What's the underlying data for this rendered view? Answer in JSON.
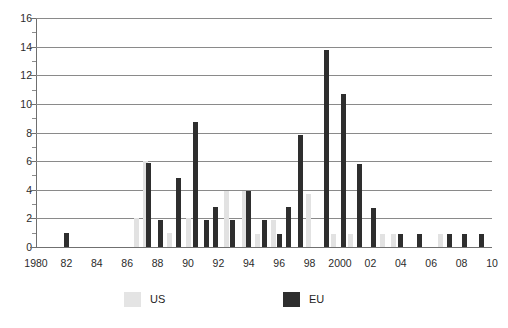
{
  "chart_data": {
    "type": "bar",
    "title": "",
    "subtitle": "",
    "xlabel": "",
    "ylabel": "",
    "xlim": [
      1980,
      2010
    ],
    "ylim": [
      0,
      16
    ],
    "ytick_step": 2,
    "yticks": [
      0,
      2,
      4,
      6,
      8,
      10,
      12,
      14,
      16
    ],
    "ytick_labels": [
      "0",
      "2",
      "4",
      "6",
      "8",
      "10",
      "12",
      "14",
      "16"
    ],
    "yminor_ticks": [
      1,
      3,
      5,
      7,
      9,
      11,
      13,
      15
    ],
    "grid": true,
    "grid_axis": "y",
    "legend_position": "bottom",
    "x": [
      1980,
      1981,
      1982,
      1983,
      1984,
      1985,
      1986,
      1987,
      1988,
      1989,
      1990,
      1991,
      1992,
      1993,
      1994,
      1995,
      1996,
      1997,
      1998,
      1999,
      2000,
      2001,
      2002,
      2003,
      2004,
      2005,
      2006,
      2007,
      2008,
      2009,
      2010
    ],
    "xtick_labels": [
      "1980",
      "82",
      "84",
      "86",
      "88",
      "90",
      "92",
      "94",
      "96",
      "98",
      "2000",
      "02",
      "04",
      "06",
      "08",
      "10"
    ],
    "xticks": [
      1980,
      1982,
      1984,
      1986,
      1988,
      1990,
      1992,
      1994,
      1996,
      1998,
      2000,
      2002,
      2004,
      2006,
      2008,
      2010
    ],
    "series": [
      {
        "name": "US",
        "color": "#e2e2e2",
        "values": [
          0,
          0,
          0,
          0,
          0,
          0,
          2,
          6,
          1,
          4.8,
          0,
          2.9,
          3.9,
          0,
          1,
          0,
          3.7,
          4.6,
          0.9,
          0.9,
          0,
          0.9,
          0.9,
          0,
          0,
          0.9,
          0,
          0,
          0,
          0,
          0
        ]
      },
      {
        "name": "EU",
        "color": "#2e2e2e",
        "values": [
          0,
          0,
          1,
          0,
          0,
          0,
          0,
          5.9,
          1.9,
          8.7,
          0,
          1.9,
          1.9,
          3.9,
          1.9,
          2.8,
          7.8,
          13.8,
          10.7,
          5.8,
          2.7,
          0,
          0.9,
          0.9,
          0,
          0.9,
          0.9,
          0.9,
          0,
          0,
          0
        ]
      }
    ],
    "bars": [
      {
        "year": 1982,
        "series": "EU",
        "value": 1
      },
      {
        "year": 1986.6,
        "series": "US",
        "value": 2
      },
      {
        "year": 1987.2,
        "series": "US",
        "value": 6
      },
      {
        "year": 1987.4,
        "series": "EU",
        "value": 5.9
      },
      {
        "year": 1988.2,
        "series": "EU",
        "value": 1.9
      },
      {
        "year": 1988.8,
        "series": "US",
        "value": 1
      },
      {
        "year": 1989.4,
        "series": "EU",
        "value": 4.8
      },
      {
        "year": 1990.0,
        "series": "US",
        "value": 2
      },
      {
        "year": 1990.5,
        "series": "EU",
        "value": 8.7
      },
      {
        "year": 1991.2,
        "series": "EU",
        "value": 1.9
      },
      {
        "year": 1991.8,
        "series": "EU",
        "value": 2.8
      },
      {
        "year": 1992.5,
        "series": "US",
        "value": 3.9
      },
      {
        "year": 1992.9,
        "series": "EU",
        "value": 1.9
      },
      {
        "year": 1993.7,
        "series": "US",
        "value": 3.9
      },
      {
        "year": 1994.0,
        "series": "EU",
        "value": 3.9
      },
      {
        "year": 1994.6,
        "series": "US",
        "value": 0.9
      },
      {
        "year": 1995.0,
        "series": "EU",
        "value": 1.9
      },
      {
        "year": 1995.6,
        "series": "US",
        "value": 1.9
      },
      {
        "year": 1996.0,
        "series": "EU",
        "value": 0.9
      },
      {
        "year": 1996.6,
        "series": "EU",
        "value": 2.8
      },
      {
        "year": 1997.4,
        "series": "EU",
        "value": 7.8
      },
      {
        "year": 1997.9,
        "series": "US",
        "value": 3.7
      },
      {
        "year": 1999.1,
        "series": "EU",
        "value": 13.8
      },
      {
        "year": 1999.6,
        "series": "US",
        "value": 0.9
      },
      {
        "year": 2000.2,
        "series": "EU",
        "value": 10.7
      },
      {
        "year": 2000.7,
        "series": "US",
        "value": 0.9
      },
      {
        "year": 2001.3,
        "series": "EU",
        "value": 5.8
      },
      {
        "year": 2002.2,
        "series": "EU",
        "value": 2.7
      },
      {
        "year": 2002.8,
        "series": "US",
        "value": 0.9
      },
      {
        "year": 2003.5,
        "series": "US",
        "value": 0.9
      },
      {
        "year": 2004.0,
        "series": "EU",
        "value": 0.9
      },
      {
        "year": 2005.2,
        "series": "EU",
        "value": 0.9
      },
      {
        "year": 2006.6,
        "series": "US",
        "value": 0.9
      },
      {
        "year": 2007.2,
        "series": "EU",
        "value": 0.9
      },
      {
        "year": 2008.2,
        "series": "EU",
        "value": 0.9
      },
      {
        "year": 2009.3,
        "series": "EU",
        "value": 0.9
      }
    ],
    "legend": [
      {
        "label": "US",
        "color": "#e2e2e2",
        "swatch": "us"
      },
      {
        "label": "EU",
        "color": "#2e2e2e",
        "swatch": "eu"
      }
    ]
  }
}
